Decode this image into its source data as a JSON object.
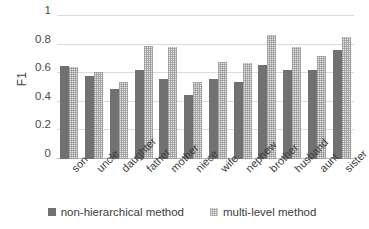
{
  "chart_data": {
    "type": "bar",
    "title": "",
    "xlabel": "",
    "ylabel": "F1",
    "ylim": [
      0,
      1
    ],
    "yticks": [
      "0",
      "0.2",
      "0.4",
      "0.6",
      "0.8",
      "1"
    ],
    "grid": true,
    "legend_position": "bottom",
    "categories": [
      "son",
      "uncle",
      "daughter",
      "father",
      "mother",
      "niece",
      "wife",
      "nephew",
      "brother",
      "husband",
      "aunt",
      "sister"
    ],
    "series": [
      {
        "name": "non-hierarchical method",
        "color": "#717171",
        "values": [
          0.65,
          0.58,
          0.49,
          0.62,
          0.56,
          0.45,
          0.56,
          0.54,
          0.66,
          0.62,
          0.62,
          0.76
        ]
      },
      {
        "name": "multi-level method",
        "color": "#e6e6e6",
        "values": [
          0.64,
          0.61,
          0.54,
          0.79,
          0.78,
          0.54,
          0.68,
          0.67,
          0.87,
          0.78,
          0.72,
          0.85
        ]
      }
    ]
  }
}
